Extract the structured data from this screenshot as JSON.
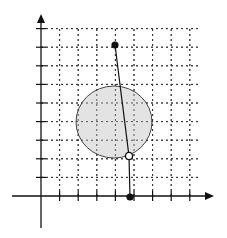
{
  "diagram": {
    "type": "coordinate-grid-with-circle",
    "grid": {
      "origin_px": [
        41,
        196
      ],
      "cell_px": 18.6,
      "x_cells": 8,
      "y_cells": 9,
      "line_style": "dotted",
      "color": "#333333"
    },
    "axes": {
      "x_axis": {
        "from_px": [
          12,
          196
        ],
        "to_px": [
          214,
          196
        ],
        "arrow": true
      },
      "y_axis": {
        "from_px": [
          41,
          228
        ],
        "to_px": [
          41,
          14
        ],
        "arrow": true
      },
      "tick_count_x": 8,
      "tick_count_y": 9
    },
    "circle": {
      "center_grid": [
        4,
        4
      ],
      "center_px": [
        114,
        122
      ],
      "rx_px": 38,
      "ry_px": 36,
      "fill": "#e3e3e3",
      "stroke": "#444444"
    },
    "points": [
      {
        "name": "top-point",
        "grid": [
          4,
          8
        ],
        "px": [
          115,
          45
        ],
        "style": "filled"
      },
      {
        "name": "circle-point",
        "grid": [
          4.8,
          2.1
        ],
        "px": [
          129,
          156
        ],
        "style": "open"
      },
      {
        "name": "axis-point",
        "grid": [
          4.8,
          0
        ],
        "px": [
          130,
          197
        ],
        "style": "filled"
      }
    ],
    "segments": [
      {
        "name": "segment-top-to-circle",
        "from": [
          115,
          45
        ],
        "to": [
          129,
          156
        ]
      },
      {
        "name": "segment-circle-to-axis",
        "from": [
          129,
          156
        ],
        "to": [
          130,
          197
        ]
      }
    ]
  }
}
